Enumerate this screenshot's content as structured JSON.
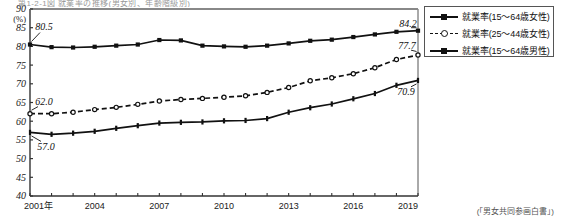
{
  "caption_strip": "第1-2-1図 就業率の推移(男女別、年齢階級別)",
  "source_note": "(「男女共同参画白書」)",
  "axis": {
    "y_unit": "(%)",
    "y_ticks": [
      "90",
      "85",
      "80",
      "75",
      "70",
      "65",
      "60",
      "55",
      "50",
      "45",
      "40"
    ],
    "x_ticks": [
      "2001年",
      "2004",
      "2007",
      "2010",
      "2013",
      "2016",
      "2019"
    ]
  },
  "legend": {
    "items": [
      {
        "label": "就業率(15～64歳女性)",
        "style": "solid-square",
        "color": "#111111"
      },
      {
        "label": "就業率(25～44歳女性)",
        "style": "dashed-circle",
        "color": "#111111"
      },
      {
        "label": "就業率(15～64歳男性)",
        "style": "solid-plus",
        "color": "#111111"
      }
    ]
  },
  "annotations": [
    {
      "name": "label-male-start",
      "text": "80.5"
    },
    {
      "name": "label-women2544-start",
      "text": "62.0"
    },
    {
      "name": "label-women1564-start",
      "text": "57.0"
    },
    {
      "name": "label-male-end",
      "text": "84.2"
    },
    {
      "name": "label-women2544-end",
      "text": "77.7"
    },
    {
      "name": "label-women1564-end",
      "text": "70.9"
    }
  ],
  "chart_data": {
    "type": "line",
    "title": "第1-2-1図 就業率の推移(男女別、年齢階級別)",
    "xlabel": "",
    "ylabel": "(%)",
    "ylim": [
      40,
      90
    ],
    "ytick_step": 5,
    "grid": false,
    "legend_position": "right-top",
    "x": [
      2001,
      2002,
      2003,
      2004,
      2005,
      2006,
      2007,
      2008,
      2009,
      2010,
      2011,
      2012,
      2013,
      2014,
      2015,
      2016,
      2017,
      2018,
      2019
    ],
    "xtick_labels": [
      "2001年",
      "2004",
      "2007",
      "2010",
      "2013",
      "2016",
      "2019"
    ],
    "series": [
      {
        "name": "就業率(15～64歳男性)",
        "marker": "square",
        "line": "solid",
        "color": "#111111",
        "values": [
          80.5,
          79.8,
          79.7,
          79.9,
          80.2,
          80.5,
          81.7,
          81.6,
          80.2,
          80.0,
          79.9,
          80.2,
          80.8,
          81.5,
          81.8,
          82.5,
          83.2,
          83.9,
          84.2
        ],
        "start_label": "80.5",
        "end_label": "84.2"
      },
      {
        "name": "就業率(25～44歳女性)",
        "marker": "circle",
        "line": "dashed",
        "color": "#111111",
        "values": [
          62.0,
          62.0,
          62.4,
          63.1,
          63.7,
          64.5,
          65.4,
          65.8,
          66.1,
          66.4,
          66.8,
          67.7,
          69.0,
          70.8,
          71.6,
          72.7,
          74.3,
          76.5,
          77.7
        ],
        "start_label": "62.0",
        "end_label": "77.7"
      },
      {
        "name": "就業率(15～64歳女性)",
        "marker": "plus",
        "line": "solid",
        "color": "#111111",
        "values": [
          57.0,
          56.5,
          56.8,
          57.3,
          58.1,
          58.8,
          59.5,
          59.7,
          59.8,
          60.1,
          60.2,
          60.7,
          62.4,
          63.6,
          64.6,
          66.0,
          67.4,
          69.6,
          70.9
        ],
        "start_label": "57.0",
        "end_label": "70.9"
      }
    ]
  }
}
